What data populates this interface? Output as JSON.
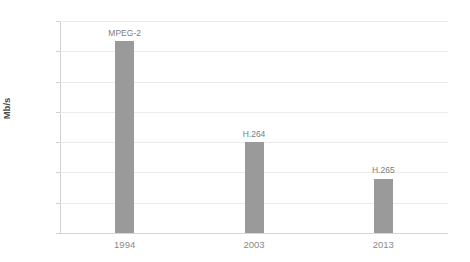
{
  "chart_data": {
    "type": "bar",
    "title": "",
    "xlabel": "",
    "ylabel": "Mb/s",
    "categories": [
      "1994",
      "2003",
      "2013"
    ],
    "values": [
      12.7,
      6.0,
      3.6
    ],
    "point_labels": [
      "MPEG-2",
      "H.264",
      "H.265"
    ],
    "ylim": [
      0,
      14
    ],
    "yticks": [
      "0",
      "2",
      "4",
      "6",
      "8",
      "10",
      "12",
      "14"
    ],
    "ytick_values": [
      0,
      2,
      4,
      6,
      8,
      10,
      12,
      14
    ],
    "grid": true,
    "legend": "none",
    "series": [
      {
        "name": "Bitrate",
        "values": [
          12.7,
          6.0,
          3.6
        ]
      }
    ],
    "colors": {
      "bar": "#9a9a9a",
      "grid": "#ebebeb",
      "axis": "#d0d0d0",
      "tick_text": "#8a8a8a",
      "label_text": "#7d7d7d",
      "axis_title": "#4a4a4a",
      "background": "#ffffff"
    }
  }
}
